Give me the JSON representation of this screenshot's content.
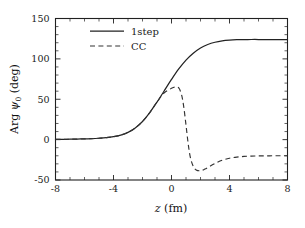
{
  "chart_data": {
    "type": "line",
    "title": "",
    "xlabel": "z (fm)",
    "xlabel_symbol": "z",
    "xlabel_unit": "(fm)",
    "ylabel": "Arg ψ₀ (deg)",
    "ylabel_prefix": "Arg",
    "ylabel_symbol": "ψ",
    "ylabel_subscript": "0",
    "ylabel_unit": "(deg)",
    "xlim": [
      -8,
      8
    ],
    "ylim": [
      -50,
      150
    ],
    "xticks": [
      -8,
      -4,
      0,
      4,
      8
    ],
    "xticklabels": [
      "-8",
      "-4",
      "0",
      "4",
      "8"
    ],
    "yticks": [
      -50,
      0,
      50,
      100,
      150
    ],
    "yticklabels": [
      "-50",
      "0",
      "50",
      "100",
      "150"
    ],
    "x_minor_step": 1,
    "y_minor_step": 10,
    "grid": false,
    "legend_position": "upper-left-inside",
    "line_color": "#222222",
    "series": [
      {
        "name": "1step",
        "style": "solid",
        "x": [
          -8.0,
          -7.5,
          -7.0,
          -6.5,
          -6.0,
          -5.5,
          -5.0,
          -4.5,
          -4.0,
          -3.5,
          -3.0,
          -2.5,
          -2.0,
          -1.5,
          -1.0,
          -0.5,
          0.0,
          0.5,
          1.0,
          1.5,
          2.0,
          2.5,
          3.0,
          3.5,
          4.0,
          4.5,
          5.0,
          5.5,
          6.0,
          6.5,
          7.0,
          7.5,
          8.0
        ],
        "values": [
          0.3,
          0.4,
          0.5,
          0.7,
          0.9,
          1.2,
          1.7,
          2.4,
          3.6,
          5.6,
          9.0,
          14.5,
          22.5,
          33.5,
          46.5,
          60.5,
          74.5,
          87.5,
          98.5,
          107.0,
          113.5,
          117.8,
          120.6,
          122.3,
          123.2,
          123.7,
          123.9,
          124.0,
          124.0,
          124.0,
          124.0,
          124.0,
          124.0
        ]
      },
      {
        "name": "CC",
        "style": "dashed",
        "x": [
          -8.0,
          -7.5,
          -7.0,
          -6.5,
          -6.0,
          -5.5,
          -5.0,
          -4.5,
          -4.0,
          -3.5,
          -3.0,
          -2.5,
          -2.0,
          -1.5,
          -1.0,
          -0.5,
          0.0,
          0.25,
          0.5,
          0.7,
          0.85,
          1.0,
          1.15,
          1.3,
          1.5,
          1.7,
          2.0,
          2.3,
          2.6,
          3.0,
          3.5,
          4.0,
          4.5,
          5.0,
          5.5,
          6.0,
          6.5,
          7.0,
          7.5,
          8.0
        ],
        "values": [
          0.3,
          0.4,
          0.5,
          0.7,
          0.9,
          1.2,
          1.7,
          2.4,
          3.6,
          5.6,
          9.0,
          14.5,
          22.5,
          33.5,
          46.5,
          58.0,
          63.5,
          65.0,
          64.0,
          55.0,
          40.0,
          18.0,
          -5.0,
          -22.0,
          -33.0,
          -37.5,
          -38.5,
          -36.5,
          -33.5,
          -29.5,
          -25.5,
          -23.0,
          -21.6,
          -20.8,
          -20.4,
          -20.2,
          -20.1,
          -20.0,
          -20.0,
          -20.0
        ]
      }
    ],
    "legend": [
      {
        "label": "1step",
        "style": "solid"
      },
      {
        "label": "CC",
        "style": "dashed"
      }
    ]
  }
}
